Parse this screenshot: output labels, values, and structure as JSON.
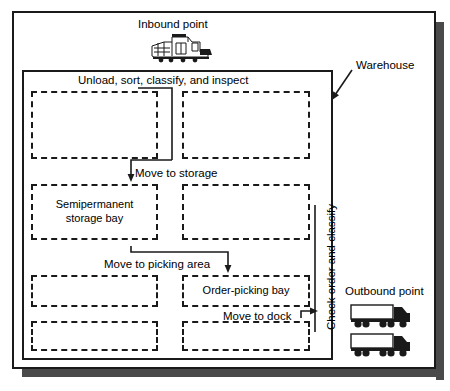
{
  "figure": {
    "type": "warehouse-flow-diagram",
    "outer_label": "Warehouse",
    "inbound": {
      "label": "Inbound point",
      "icon": "train-locomotive-icon"
    },
    "outbound": {
      "label": "Outbound point",
      "icon": "semi-truck-icon",
      "count": 2
    },
    "process_steps": [
      {
        "id": "unload",
        "label": "Unload, sort, classify, and inspect"
      },
      {
        "id": "move-storage",
        "label": "Move to storage"
      },
      {
        "id": "move-picking",
        "label": "Move to picking area"
      },
      {
        "id": "move-dock",
        "label": "Move to dock"
      },
      {
        "id": "check-order",
        "label": "Check order and classify",
        "orientation": "vertical"
      }
    ],
    "bays": [
      {
        "row": 1,
        "col": 1,
        "label": ""
      },
      {
        "row": 1,
        "col": 2,
        "label": ""
      },
      {
        "row": 2,
        "col": 1,
        "label": "Semipermanent\nstorage bay",
        "line1": "Semipermanent",
        "line2": "storage bay"
      },
      {
        "row": 2,
        "col": 2,
        "label": ""
      },
      {
        "row": 3,
        "col": 1,
        "label": ""
      },
      {
        "row": 3,
        "col": 2,
        "label": "Order-picking bay"
      },
      {
        "row": 4,
        "col": 1,
        "label": ""
      },
      {
        "row": 4,
        "col": 2,
        "label": ""
      }
    ],
    "colors": {
      "line": "#1a1a1a",
      "shadow": "#4a4a4a",
      "page": "#ffffff"
    }
  }
}
